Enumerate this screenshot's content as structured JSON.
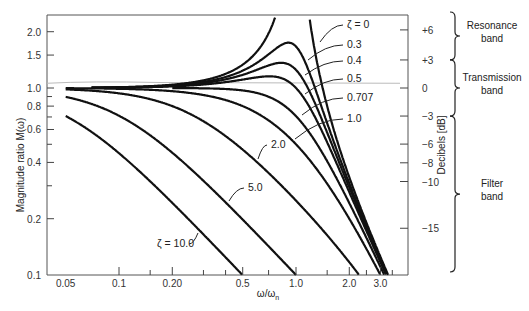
{
  "chart_data": {
    "type": "line",
    "title": "",
    "xlabel": "ω/ω_n",
    "ylabel": "Magnitude ratio M(ω)",
    "ylabel_right": "Decibels [dB]",
    "xscale": "log",
    "yscale": "log",
    "xlim": [
      0.05,
      4.0
    ],
    "ylim": [
      0.1,
      2.4
    ],
    "grid": false,
    "x_ticks": [
      {
        "value": 0.05,
        "label": "0.05"
      },
      {
        "value": 0.1,
        "label": "0.1"
      },
      {
        "value": 0.2,
        "label": "0.20"
      },
      {
        "value": 0.5,
        "label": "0.5"
      },
      {
        "value": 1.0,
        "label": "1.0"
      },
      {
        "value": 2.0,
        "label": "2.0"
      },
      {
        "value": 3.0,
        "label": "3.0"
      }
    ],
    "x_minor_ticks": [
      0.15,
      0.3,
      0.4,
      0.7,
      1.5,
      2.5,
      3.5
    ],
    "y_ticks": [
      {
        "value": 0.1,
        "label": "0.1"
      },
      {
        "value": 0.2,
        "label": "0.2"
      },
      {
        "value": 0.4,
        "label": "0.4"
      },
      {
        "value": 0.6,
        "label": "0.6"
      },
      {
        "value": 0.8,
        "label": "0.8"
      },
      {
        "value": 1.0,
        "label": "1.0"
      },
      {
        "value": 1.5,
        "label": "1.5"
      },
      {
        "value": 2.0,
        "label": "2.0"
      }
    ],
    "y_minor_ticks": [
      0.3,
      0.5,
      0.7,
      0.9
    ],
    "right_axis_ticks": [
      {
        "db": 6,
        "label": "+6"
      },
      {
        "db": 3,
        "label": "+3"
      },
      {
        "db": 0,
        "label": "0"
      },
      {
        "db": -3,
        "label": "−3"
      },
      {
        "db": -6,
        "label": "−6"
      },
      {
        "db": -8,
        "label": "−8"
      },
      {
        "db": -10,
        "label": "−10"
      },
      {
        "db": -15,
        "label": "−15"
      }
    ],
    "bands": [
      {
        "label": "Resonance band",
        "db_range": [
          3,
          6.5
        ]
      },
      {
        "label": "Transmission band",
        "db_range": [
          -3,
          3
        ]
      },
      {
        "label": "Filter band",
        "db_range": [
          -22,
          -3
        ]
      }
    ],
    "series": [
      {
        "name": "ζ = 0",
        "zeta": 0
      },
      {
        "name": "0.3",
        "zeta": 0.3
      },
      {
        "name": "0.4",
        "zeta": 0.4
      },
      {
        "name": "0.5",
        "zeta": 0.5
      },
      {
        "name": "0.707",
        "zeta": 0.707
      },
      {
        "name": "1.0",
        "zeta": 1.0
      },
      {
        "name": "2.0",
        "zeta": 2.0
      },
      {
        "name": "5.0",
        "zeta": 5.0
      },
      {
        "name": "ζ = 10.0",
        "zeta": 10.0
      }
    ],
    "formula": "M(ω) = 1 / sqrt((1 − (ω/ωn)^2)^2 + (2ζ ω/ωn)^2)",
    "sample_values": {
      "zeta_0.3_peak": 1.75,
      "zeta_0.4_peak": 1.36,
      "zeta_0.5_peak": 1.15,
      "zeta_1.0_at_1.0": 0.5,
      "zeta_2.0_at_1.0": 0.25,
      "zeta_5.0_at_1.0": 0.1,
      "zeta_10.0_at_0.5": 0.1
    }
  }
}
